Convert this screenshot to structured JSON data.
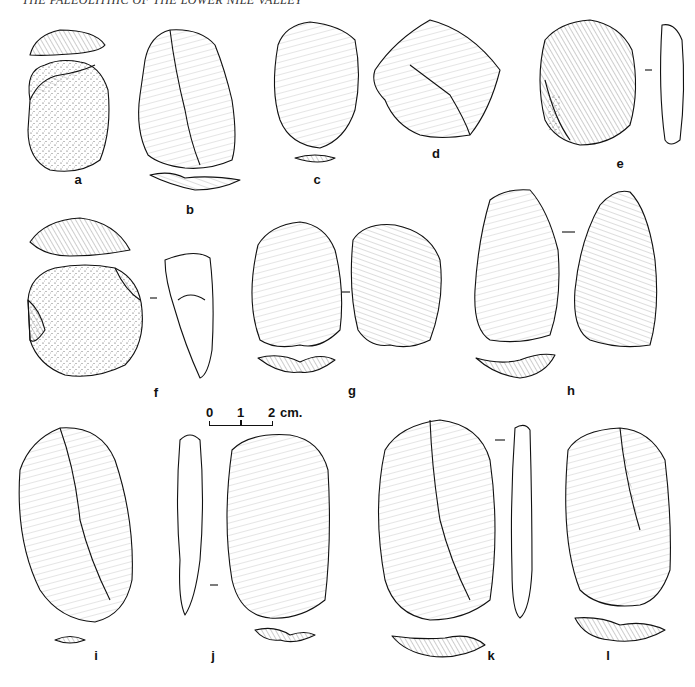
{
  "header": {
    "running_title": "THE PALEOLITHIC OF THE LOWER NILE VALLEY"
  },
  "figure": {
    "type": "lithic artifact illustration plate",
    "scale_bar": {
      "tick0": "0",
      "tick1": "1",
      "tick2": "2",
      "unit": "cm."
    },
    "artifacts": [
      {
        "label": "a",
        "views": [
          "platform",
          "dorsal (cortex)"
        ]
      },
      {
        "label": "b",
        "views": [
          "dorsal",
          "section"
        ]
      },
      {
        "label": "c",
        "views": [
          "dorsal",
          "butt"
        ]
      },
      {
        "label": "d",
        "views": [
          "dorsal"
        ]
      },
      {
        "label": "e",
        "views": [
          "dorsal",
          "profile"
        ]
      },
      {
        "label": "f",
        "views": [
          "platform",
          "dorsal (cortex)",
          "profile"
        ]
      },
      {
        "label": "g",
        "views": [
          "dorsal",
          "ventral",
          "butt"
        ]
      },
      {
        "label": "h",
        "views": [
          "dorsal",
          "ventral",
          "butt"
        ]
      },
      {
        "label": "i",
        "views": [
          "dorsal",
          "butt"
        ]
      },
      {
        "label": "j",
        "views": [
          "profile",
          "dorsal",
          "butt"
        ]
      },
      {
        "label": "k",
        "views": [
          "dorsal",
          "profile",
          "butt"
        ]
      },
      {
        "label": "l",
        "views": [
          "dorsal",
          "butt"
        ]
      }
    ]
  }
}
